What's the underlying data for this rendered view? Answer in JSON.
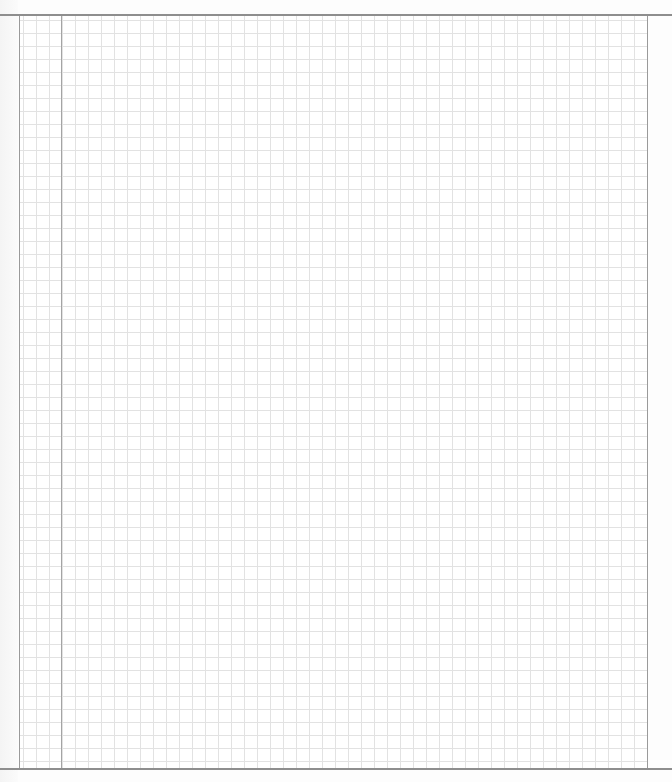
{
  "page": {
    "type": "blank-graph-paper",
    "grid": {
      "cell_size_px": 13,
      "line_color": "#e2e2e2",
      "border_color": "#9a9a9a",
      "margin_line_color": "#a4a4a4"
    },
    "content": ""
  }
}
